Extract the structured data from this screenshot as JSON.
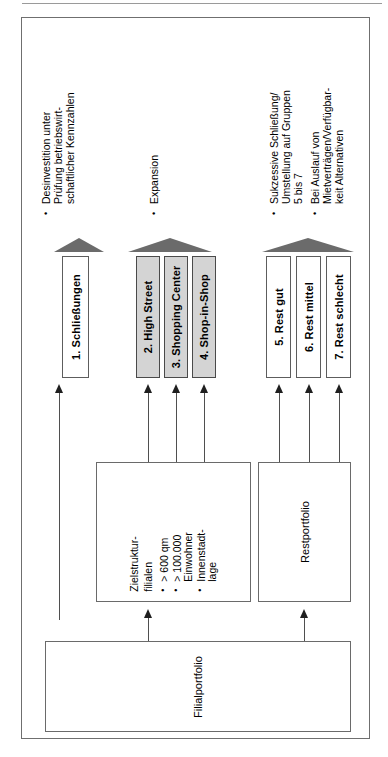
{
  "diagram": {
    "base_box": {
      "label": "Filialportfolio"
    },
    "source_boxes": [
      {
        "name": "zielstrukturfilialen",
        "title_line1": "Zielstruktur-",
        "title_line2": "filialen",
        "criteria": [
          "> 600 qm",
          "> 100.000\nEinwohner",
          "Innenstadt-\nlage"
        ]
      },
      {
        "name": "restportfolio",
        "label": "Restportfolio"
      }
    ],
    "categories": [
      {
        "label": "1. Schließungen",
        "shaded": false
      },
      {
        "label": "2. High Street",
        "shaded": true
      },
      {
        "label": "3. Shopping Center",
        "shaded": true
      },
      {
        "label": "4. Shop-in-Shop",
        "shaded": true
      },
      {
        "label": "5. Rest gut",
        "shaded": false
      },
      {
        "label": "6. Rest mittel",
        "shaded": false
      },
      {
        "label": "7. Rest schlecht",
        "shaded": false
      }
    ],
    "annotations": [
      {
        "group": "closures",
        "items": [
          "Desinvestition unter\nPrüfung betriebswirt-\nschaftlicher Kennzahlen"
        ]
      },
      {
        "group": "target-structure",
        "items": [
          "Expansion"
        ]
      },
      {
        "group": "remainder",
        "items": [
          "Sukzessive Schließung/\nUmstellung auf Gruppen\n5 bis 7",
          "Bei Auslauf von\nMietverträgen/Verfügbar-\nkeit Alternativen"
        ]
      }
    ],
    "colors": {
      "frame": "#6f6f6f",
      "box_border": "#5d5d5d",
      "shaded_fill": "#d4d4d4",
      "arrow": "#4f4f4f",
      "triangle": "#6b6b6b",
      "text": "#000000",
      "page_background": "#ffffff"
    }
  }
}
